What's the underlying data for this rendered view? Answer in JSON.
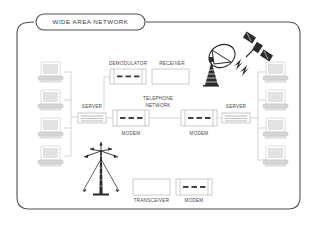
{
  "diagram": {
    "title": "WIDE AREA NETWORK",
    "labels": {
      "demodulator": "DEMODULATOR",
      "receiver": "RECEIVER",
      "server_left": "SERVER",
      "server_right": "SERVER",
      "telephone_network_line1": "TELEPHONE",
      "telephone_network_line2": "NETWORK",
      "modem_left": "MODEM",
      "modem_right": "MODEM",
      "transceiver": "TRANSCEIVER",
      "modem_bottom": "MODEM"
    },
    "colors": {
      "frame": "#4f4f4f",
      "wire": "#c9c9c9",
      "box_stroke": "#b5b5b5",
      "label_text": "#4a4a4a",
      "title_text": "#3c3c3c",
      "icon_dark": "#2b2b2b",
      "background": "#ffffff"
    },
    "nodes": [
      {
        "name": "workstation-left-1",
        "type": "computer",
        "side": "left"
      },
      {
        "name": "workstation-left-2",
        "type": "computer",
        "side": "left"
      },
      {
        "name": "workstation-left-3",
        "type": "computer",
        "side": "left"
      },
      {
        "name": "workstation-left-4",
        "type": "computer",
        "side": "left"
      },
      {
        "name": "server-left",
        "type": "server",
        "label": "SERVER"
      },
      {
        "name": "modem-left",
        "type": "modem",
        "label": "MODEM"
      },
      {
        "name": "demodulator",
        "type": "device",
        "label": "DEMODULATOR"
      },
      {
        "name": "receiver",
        "type": "device",
        "label": "RECEIVER"
      },
      {
        "name": "telephone-network",
        "type": "cloud",
        "label": "TELEPHONE NETWORK"
      },
      {
        "name": "modem-right",
        "type": "modem",
        "label": "MODEM"
      },
      {
        "name": "server-right",
        "type": "server",
        "label": "SERVER"
      },
      {
        "name": "workstation-right-1",
        "type": "computer",
        "side": "right"
      },
      {
        "name": "workstation-right-2",
        "type": "computer",
        "side": "right"
      },
      {
        "name": "workstation-right-3",
        "type": "computer",
        "side": "right"
      },
      {
        "name": "workstation-right-4",
        "type": "computer",
        "side": "right"
      },
      {
        "name": "satellite-dish",
        "type": "antenna"
      },
      {
        "name": "satellite",
        "type": "satellite"
      },
      {
        "name": "radio-tower",
        "type": "tower"
      },
      {
        "name": "transceiver",
        "type": "device",
        "label": "TRANSCEIVER"
      },
      {
        "name": "modem-bottom",
        "type": "modem",
        "label": "MODEM"
      }
    ]
  }
}
